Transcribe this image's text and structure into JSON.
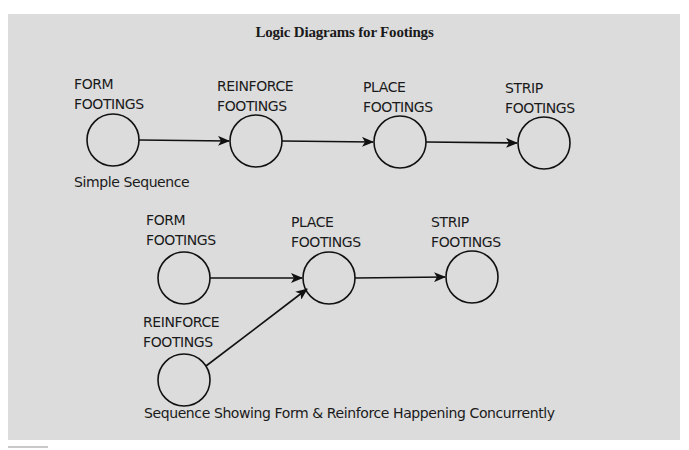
{
  "figure": {
    "title": "Logic Diagrams for Footings",
    "background_color": "#dcdcdc",
    "line_color": "#111111"
  },
  "simple_sequence": {
    "caption": "Simple Sequence",
    "nodes": [
      {
        "id": "form",
        "line1": "FORM",
        "line2": "FOOTINGS"
      },
      {
        "id": "reinforce",
        "line1": "REINFORCE",
        "line2": "FOOTINGS"
      },
      {
        "id": "place",
        "line1": "PLACE",
        "line2": "FOOTINGS"
      },
      {
        "id": "strip",
        "line1": "STRIP",
        "line2": "FOOTINGS"
      }
    ],
    "edges": [
      {
        "from": "form",
        "to": "reinforce"
      },
      {
        "from": "reinforce",
        "to": "place"
      },
      {
        "from": "place",
        "to": "strip"
      }
    ]
  },
  "concurrent_sequence": {
    "caption": "Sequence Showing Form & Reinforce Happening Concurrently",
    "nodes": [
      {
        "id": "form",
        "line1": "FORM",
        "line2": "FOOTINGS"
      },
      {
        "id": "place",
        "line1": "PLACE",
        "line2": "FOOTINGS"
      },
      {
        "id": "strip",
        "line1": "STRIP",
        "line2": "FOOTINGS"
      },
      {
        "id": "reinforce",
        "line1": "REINFORCE",
        "line2": "FOOTINGS"
      }
    ],
    "edges": [
      {
        "from": "form",
        "to": "place"
      },
      {
        "from": "reinforce",
        "to": "place"
      },
      {
        "from": "place",
        "to": "strip"
      }
    ]
  }
}
